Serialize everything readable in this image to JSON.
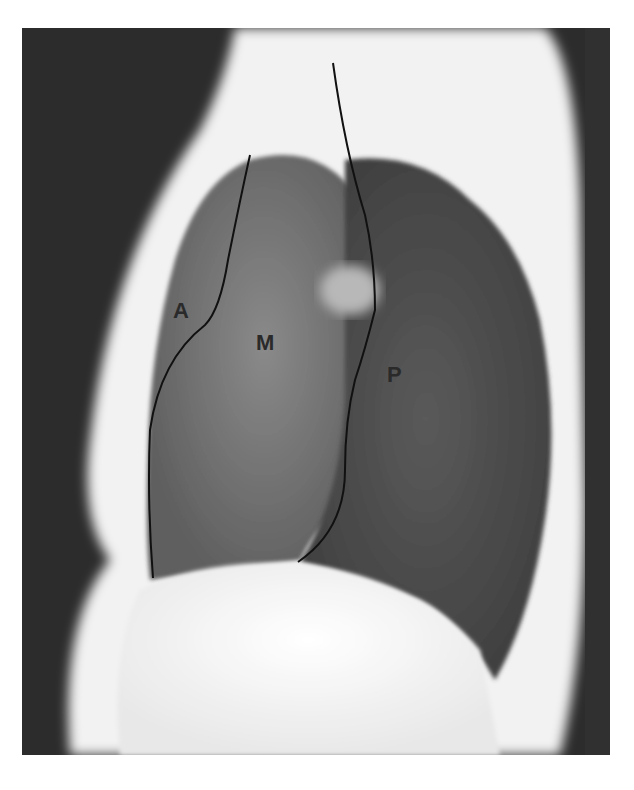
{
  "figure": {
    "type": "lateral chest radiograph",
    "labels": [
      {
        "id": "anterior",
        "text": "A",
        "x": 173,
        "y": 298
      },
      {
        "id": "middle",
        "text": "M",
        "x": 256,
        "y": 330
      },
      {
        "id": "posterior",
        "text": "P",
        "x": 387,
        "y": 362
      }
    ],
    "colors": {
      "background": "#ffffff",
      "dark_air": "#2c2c2c",
      "soft_tissue": "#f4f4f4",
      "lung": "#707070",
      "line": "#111111"
    }
  }
}
